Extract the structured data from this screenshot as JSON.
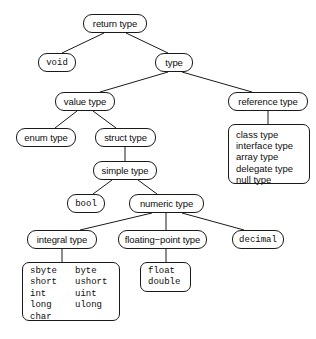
{
  "diagram": {
    "type": "tree",
    "stroke_color": "#1a1a1a",
    "background_color": "#ffffff",
    "nodes": {
      "return_type": {
        "label": "return type",
        "style": "term"
      },
      "void": {
        "label": "void",
        "style": "code"
      },
      "type": {
        "label": "type",
        "style": "term"
      },
      "value_type": {
        "label": "value type",
        "style": "term"
      },
      "reference_type": {
        "label": "reference type",
        "style": "term"
      },
      "enum_type": {
        "label": "enum type",
        "style": "term"
      },
      "struct_type": {
        "label": "struct type",
        "style": "term"
      },
      "simple_type": {
        "label": "simple type",
        "style": "term"
      },
      "bool": {
        "label": "bool",
        "style": "code"
      },
      "numeric_type": {
        "label": "numeric type",
        "style": "term"
      },
      "integral_type": {
        "label": "integral type",
        "style": "term"
      },
      "floating_point_type": {
        "label": "floating−point type",
        "style": "term"
      },
      "decimal": {
        "label": "decimal",
        "style": "code"
      }
    },
    "reference_type_list": [
      "class type",
      "interface type",
      "array type",
      "delegate type",
      "null type"
    ],
    "integral_type_list": {
      "rows": [
        {
          "left": "sbyte",
          "right": "byte"
        },
        {
          "left": "short",
          "right": "ushort"
        },
        {
          "left": "int",
          "right": "uint"
        },
        {
          "left": "long",
          "right": "ulong"
        },
        {
          "left": "char",
          "right": ""
        }
      ]
    },
    "floating_point_list": [
      "float",
      "double"
    ],
    "edges": [
      {
        "from": "return_type",
        "to": "void"
      },
      {
        "from": "return_type",
        "to": "type"
      },
      {
        "from": "type",
        "to": "value_type"
      },
      {
        "from": "type",
        "to": "reference_type"
      },
      {
        "from": "reference_type",
        "to": "reference_type_list"
      },
      {
        "from": "value_type",
        "to": "enum_type"
      },
      {
        "from": "value_type",
        "to": "struct_type"
      },
      {
        "from": "struct_type",
        "to": "simple_type"
      },
      {
        "from": "simple_type",
        "to": "bool"
      },
      {
        "from": "simple_type",
        "to": "numeric_type"
      },
      {
        "from": "numeric_type",
        "to": "integral_type"
      },
      {
        "from": "numeric_type",
        "to": "floating_point_type"
      },
      {
        "from": "numeric_type",
        "to": "decimal"
      },
      {
        "from": "integral_type",
        "to": "integral_type_list"
      },
      {
        "from": "floating_point_type",
        "to": "floating_point_list"
      }
    ]
  }
}
